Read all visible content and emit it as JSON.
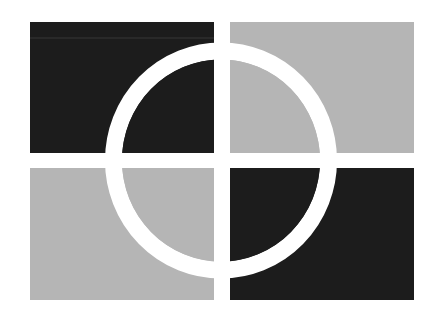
{
  "graphic": {
    "description": "Four-quadrant logo mark with a white ring overlay",
    "colors": {
      "background": "#ffffff",
      "dark": "#1c1c1c",
      "light": "#b5b5b5",
      "ring": "#ffffff",
      "faint_line": "#2e2e2e"
    },
    "quadrants": [
      {
        "name": "top-left",
        "tone": "dark"
      },
      {
        "name": "top-right",
        "tone": "light"
      },
      {
        "name": "bottom-left",
        "tone": "light"
      },
      {
        "name": "bottom-right",
        "tone": "dark"
      }
    ]
  }
}
